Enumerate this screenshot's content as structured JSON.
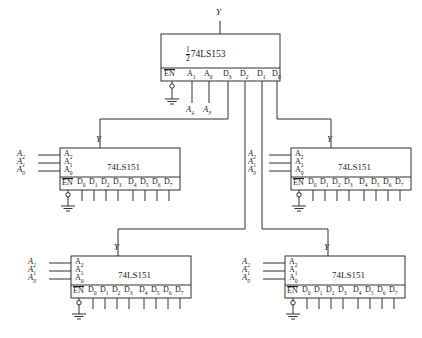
{
  "diagram": {
    "output_label": "Y",
    "ground_symbol": "GND",
    "enable_label": "EN",
    "half_numerator": "1",
    "half_denominator": "2"
  },
  "chips": [
    {
      "id": "mux-153-top",
      "name": "74LS153",
      "prefix_fraction": true,
      "output_label": "Y",
      "enable_label": "EN",
      "select_pins": [
        "A",
        "A"
      ],
      "select_subs": [
        "1",
        "0"
      ],
      "data_pins": [
        "D",
        "D",
        "D",
        "D"
      ],
      "data_subs": [
        "3",
        "2",
        "1",
        "0"
      ],
      "external_inputs": [
        "A",
        "A"
      ],
      "external_input_subs": [
        "4",
        "3"
      ]
    },
    {
      "id": "mux-151-upper-left",
      "name": "74LS151",
      "output_label": "Y",
      "enable_label": "EN",
      "address_pins": [
        "A",
        "A",
        "A"
      ],
      "address_subs": [
        "2",
        "1",
        "0"
      ],
      "external_inputs": [
        "A",
        "A",
        "A"
      ],
      "external_input_subs": [
        "2",
        "1",
        "0"
      ],
      "data_pins": [
        "D",
        "D",
        "D",
        "D",
        "D",
        "D",
        "D",
        "D"
      ],
      "data_subs": [
        "0",
        "1",
        "2",
        "3",
        "4",
        "5",
        "6",
        "7"
      ]
    },
    {
      "id": "mux-151-upper-right",
      "name": "74LS151",
      "output_label": "Y",
      "enable_label": "EN",
      "address_pins": [
        "A",
        "A",
        "A"
      ],
      "address_subs": [
        "2",
        "1",
        "0"
      ],
      "external_inputs": [
        "A",
        "A",
        "A"
      ],
      "external_input_subs": [
        "2",
        "1",
        "0"
      ],
      "data_pins": [
        "D",
        "D",
        "D",
        "D",
        "D",
        "D",
        "D",
        "D"
      ],
      "data_subs": [
        "0",
        "1",
        "2",
        "3",
        "4",
        "5",
        "6",
        "7"
      ]
    },
    {
      "id": "mux-151-lower-left",
      "name": "74LS151",
      "output_label": "Y",
      "enable_label": "EN",
      "address_pins": [
        "A",
        "A",
        "A"
      ],
      "address_subs": [
        "2",
        "1",
        "0"
      ],
      "external_inputs": [
        "A",
        "A",
        "A"
      ],
      "external_input_subs": [
        "2",
        "1",
        "0"
      ],
      "data_pins": [
        "D",
        "D",
        "D",
        "D",
        "D",
        "D",
        "D",
        "D"
      ],
      "data_subs": [
        "0",
        "1",
        "2",
        "3",
        "4",
        "5",
        "6",
        "7"
      ]
    },
    {
      "id": "mux-151-lower-right",
      "name": "74LS151",
      "output_label": "Y",
      "enable_label": "EN",
      "address_pins": [
        "A",
        "A",
        "A"
      ],
      "address_subs": [
        "2",
        "1",
        "0"
      ],
      "external_inputs": [
        "A",
        "A",
        "A"
      ],
      "external_input_subs": [
        "2",
        "1",
        "0"
      ],
      "data_pins": [
        "D",
        "D",
        "D",
        "D",
        "D",
        "D",
        "D",
        "D"
      ],
      "data_subs": [
        "0",
        "1",
        "2",
        "3",
        "4",
        "5",
        "6",
        "7"
      ]
    }
  ],
  "colors": {
    "line": "#1a1a1a",
    "background": "#ffffff",
    "text": "#1a1a1a"
  }
}
